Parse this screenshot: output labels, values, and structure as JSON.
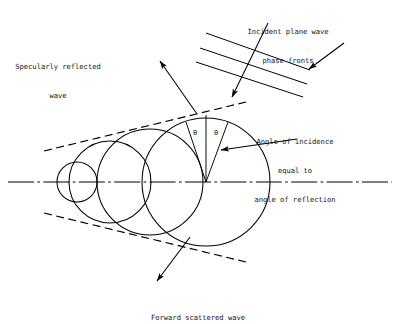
{
  "figure": {
    "type": "diagram",
    "background_color": "#ffffff",
    "line_color": "#000000"
  },
  "labels": {
    "incident": {
      "name": "incident-plane-wave-label",
      "line1": "Incident plane wave",
      "line2": "phase fronts",
      "x": 288,
      "y": 8
    },
    "specular": {
      "name": "specularly-reflected-wave-label",
      "line1": "Specularly reflected",
      "line2": "wave",
      "x": 58,
      "y": 43
    },
    "angle": {
      "name": "angle-of-incidence-label",
      "line1": "Angle of incidence",
      "line2": "equal to",
      "line3": "angle of reflection",
      "x": 295,
      "y": 118
    },
    "forward": {
      "name": "forward-scattered-wave-label",
      "line1": "Forward scattered wave",
      "x": 198,
      "y": 294
    },
    "theta_left": "θ",
    "theta_right": "θ"
  },
  "geometry": {
    "axis": {
      "y": 182,
      "x_start": 8,
      "x_end": 392,
      "style": "dash-dot"
    },
    "circles": [
      {
        "name": "circle-1-smallest",
        "cx": 77,
        "cy": 182,
        "r": 20
      },
      {
        "name": "circle-2",
        "cx": 110,
        "cy": 182,
        "r": 41
      },
      {
        "name": "circle-3",
        "cx": 150,
        "cy": 182,
        "r": 53
      },
      {
        "name": "circle-4-largest",
        "cx": 206,
        "cy": 182,
        "r": 64
      }
    ],
    "cone_tangents": [
      {
        "name": "upper-dashed-tangent",
        "x1": 44,
        "y1": 151,
        "x2": 250,
        "y2": 101
      },
      {
        "name": "lower-dashed-tangent",
        "x1": 44,
        "y1": 213,
        "x2": 250,
        "y2": 263
      }
    ],
    "phase_fronts": [
      {
        "x1": 206,
        "y1": 33,
        "x2": 310,
        "y2": 70
      },
      {
        "x1": 200,
        "y1": 48,
        "x2": 307,
        "y2": 84
      },
      {
        "x1": 196,
        "y1": 62,
        "x2": 303,
        "y2": 97
      }
    ],
    "arrows": [
      {
        "name": "incident-direction-arrow",
        "x1": 268,
        "y1": 23,
        "x2": 232,
        "y2": 97
      },
      {
        "name": "phase-front-pointer-arrow",
        "x1": 344,
        "y1": 43,
        "x2": 309,
        "y2": 69
      },
      {
        "name": "specular-reflection-arrow",
        "x1": 197,
        "y1": 114,
        "x2": 160,
        "y2": 61
      },
      {
        "name": "angle-pointer-arrow",
        "x1": 297,
        "y1": 139,
        "x2": 221,
        "y2": 150
      },
      {
        "name": "forward-scatter-arrow",
        "x1": 190,
        "y1": 237,
        "x2": 157,
        "y2": 281
      }
    ],
    "angle_rays": [
      {
        "name": "normal-ray",
        "x1": 206,
        "y1": 182,
        "x2": 206,
        "y2": 115
      },
      {
        "name": "incident-ray",
        "x1": 206,
        "y1": 182,
        "x2": 186,
        "y2": 122
      },
      {
        "name": "reflected-ray",
        "x1": 206,
        "y1": 182,
        "x2": 228,
        "y2": 122
      }
    ],
    "theta_positions": [
      {
        "x": 193,
        "y": 129
      },
      {
        "x": 214,
        "y": 129
      }
    ]
  }
}
